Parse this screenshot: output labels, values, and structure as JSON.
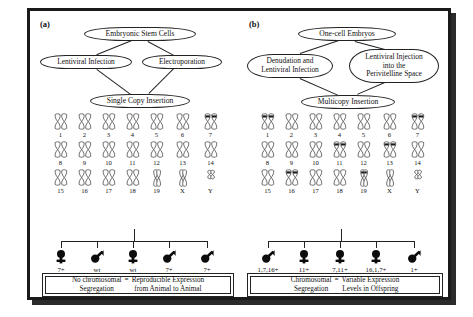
{
  "figure": {
    "panels": [
      {
        "id": "a",
        "label": "(a)",
        "nodes": {
          "source": "Embryonic Stem Cells",
          "method_left": "Lentiviral Infection",
          "method_right": "Electroporation",
          "outcome": "Single Copy Insertion"
        },
        "karyotype": {
          "rows": [
            [
              "1",
              "2",
              "3",
              "4",
              "5",
              "6",
              "7"
            ],
            [
              "8",
              "9",
              "10",
              "11",
              "12",
              "13",
              "14"
            ],
            [
              "15",
              "16",
              "17",
              "18",
              "19",
              "X",
              "Y"
            ]
          ],
          "marked": [
            "7"
          ]
        },
        "offspring": [
          {
            "sex": "female-symbol",
            "label": "7+"
          },
          {
            "sex": "male-symbol",
            "label": "wt"
          },
          {
            "sex": "female-symbol",
            "label": "wt"
          },
          {
            "sex": "male-symbol",
            "label": "7+"
          },
          {
            "sex": "male-symbol",
            "label": "7+"
          }
        ],
        "conclusion": {
          "left_line1": "No chromosomal",
          "left_line2": "Segregation",
          "equals": "=",
          "right_line1": "Reproducible Expression",
          "right_line2": "from Animal to Animal"
        }
      },
      {
        "id": "b",
        "label": "(b)",
        "nodes": {
          "source": "One-cell Embryos",
          "method_left": "Denudation and\nLentiviral Infection",
          "method_right": "Lentiviral Injection\ninto the\nPerivitelline Space",
          "outcome": "Multicopy Insertion"
        },
        "karyotype": {
          "rows": [
            [
              "1",
              "2",
              "3",
              "4",
              "5",
              "6",
              "7"
            ],
            [
              "8",
              "9",
              "10",
              "11",
              "12",
              "13",
              "14"
            ],
            [
              "15",
              "16",
              "17",
              "18",
              "19",
              "X",
              "Y"
            ]
          ],
          "marked": [
            "1",
            "7",
            "11",
            "13",
            "16",
            "19"
          ]
        },
        "offspring": [
          {
            "sex": "male-symbol",
            "label": "1,7,16+"
          },
          {
            "sex": "female-symbol",
            "label": "11+"
          },
          {
            "sex": "female-symbol",
            "label": "7,11+"
          },
          {
            "sex": "female-symbol",
            "label": "16,1,7+"
          },
          {
            "sex": "male-symbol",
            "label": "1+"
          }
        ],
        "conclusion": {
          "left_line1": "Chromosomal",
          "left_line2": "Segregation",
          "equals": "=",
          "right_line1": "Variable Expression",
          "right_line2": "Levels in Offspring"
        }
      }
    ]
  },
  "style": {
    "ink": "#1a1a1a",
    "paper": "#ffffff",
    "shadow": "#2b2b2b"
  }
}
